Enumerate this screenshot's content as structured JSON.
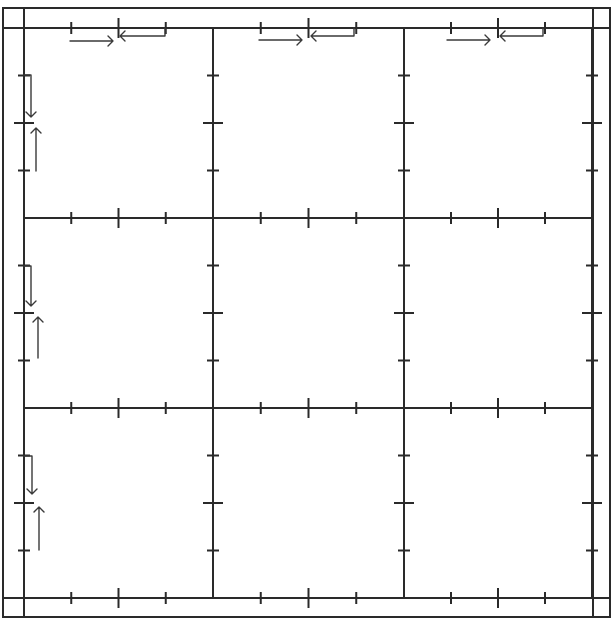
{
  "diagram": {
    "title": "",
    "colors": {
      "background": "#ffffff",
      "line": "#2a2a2a",
      "arrow": "#3a3a3a"
    },
    "outer_border": {
      "x1": 3,
      "y1": 8,
      "x2": 610,
      "y2": 617
    },
    "margin_lines": {
      "left_x": 24,
      "right_x": 593,
      "top_y": 28,
      "bottom_y": 598
    },
    "grid": {
      "rows": 3,
      "cols": 3,
      "x_lines": [
        24,
        213,
        404,
        592
      ],
      "y_lines": [
        28,
        218,
        408,
        598
      ]
    },
    "ticks": {
      "positions": [
        "1/4",
        "1/2",
        "3/4"
      ],
      "short_length": 12,
      "long_length": 20
    },
    "arrows": {
      "top_row": [
        {
          "cell": 0,
          "right_arrow": {
            "x1": 70,
            "x2": 113,
            "y": 41
          },
          "left_arrow": {
            "x1": 165,
            "x2": 120,
            "y": 36
          }
        },
        {
          "cell": 1,
          "right_arrow": {
            "x1": 259,
            "x2": 302,
            "y": 40
          },
          "left_arrow": {
            "x1": 354,
            "x2": 311,
            "y": 36
          }
        },
        {
          "cell": 2,
          "right_arrow": {
            "x1": 447,
            "x2": 490,
            "y": 40
          },
          "left_arrow": {
            "x1": 543,
            "x2": 500,
            "y": 36
          }
        }
      ],
      "left_column": [
        {
          "cell": 0,
          "down_arrow": {
            "y1": 75,
            "y2": 117,
            "x": 31
          },
          "up_arrow": {
            "y1": 171,
            "y2": 128,
            "x": 36
          }
        },
        {
          "cell": 1,
          "down_arrow": {
            "y1": 266,
            "y2": 306,
            "x": 31
          },
          "up_arrow": {
            "y1": 358,
            "y2": 317,
            "x": 38
          }
        },
        {
          "cell": 2,
          "down_arrow": {
            "y1": 456,
            "y2": 494,
            "x": 32
          },
          "up_arrow": {
            "y1": 550,
            "y2": 507,
            "x": 39
          }
        }
      ]
    },
    "cells": [
      {
        "id": "r1c1",
        "label": ""
      },
      {
        "id": "r1c2",
        "label": ""
      },
      {
        "id": "r1c3",
        "label": ""
      },
      {
        "id": "r2c1",
        "label": ""
      },
      {
        "id": "r2c2",
        "label": ""
      },
      {
        "id": "r2c3",
        "label": ""
      },
      {
        "id": "r3c1",
        "label": ""
      },
      {
        "id": "r3c2",
        "label": ""
      },
      {
        "id": "r3c3",
        "label": ""
      }
    ]
  }
}
